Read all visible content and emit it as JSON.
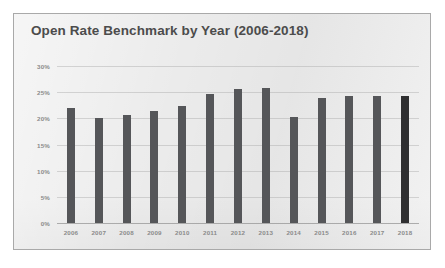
{
  "chart_data": {
    "type": "bar",
    "title": "Open Rate Benchmark by Year (2006-2018)",
    "xlabel": "",
    "ylabel": "",
    "categories": [
      "2006",
      "2007",
      "2008",
      "2009",
      "2010",
      "2011",
      "2012",
      "2013",
      "2014",
      "2015",
      "2016",
      "2017",
      "2018"
    ],
    "values": [
      22.0,
      20.0,
      20.7,
      21.4,
      22.4,
      24.7,
      25.6,
      25.8,
      20.3,
      23.8,
      24.3,
      24.3,
      24.3
    ],
    "ylim": [
      0,
      30
    ],
    "ytick_values": [
      0,
      5,
      10,
      15,
      20,
      25,
      30
    ],
    "ytick_labels": [
      "0%",
      "5%",
      "10%",
      "15%",
      "20%",
      "25%",
      "30%"
    ],
    "grid": true,
    "legend": null,
    "legend_position": "none",
    "series": [
      {
        "name": "Open Rate",
        "values": [
          22.0,
          20.0,
          20.7,
          21.4,
          22.4,
          24.7,
          25.6,
          25.8,
          20.3,
          23.8,
          24.3,
          24.3,
          24.3
        ]
      }
    ],
    "highlighted_category": "2018",
    "colors": {
      "bar": "#555659",
      "bar_highlight": "#2f2f31",
      "panel_background": "#ebebeb",
      "panel_border": "#a9a9a9",
      "title_text": "#4c4c4c",
      "tick_text": "#8a8a8a",
      "gridline": "#aaaaaa",
      "page_background": "#ffffff"
    }
  }
}
